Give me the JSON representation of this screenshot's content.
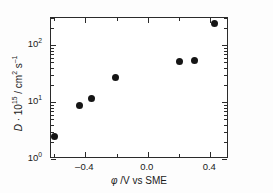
{
  "chart_data": {
    "type": "scatter",
    "title": "",
    "xlabel": "φ /V vs SME",
    "ylabel": "D · 10¹⁵ / cm² s⁻¹",
    "xlim": [
      -0.62,
      0.52
    ],
    "ylim": [
      1,
      300
    ],
    "yscale": "log",
    "xscale": "linear",
    "grid": false,
    "legend": false,
    "x": [
      -0.6,
      -0.44,
      -0.36,
      -0.21,
      0.2,
      0.3,
      0.43
    ],
    "y": [
      2.5,
      8.7,
      11.5,
      27,
      52,
      53,
      240
    ],
    "points": [
      {
        "x": -0.6,
        "y": 2.5
      },
      {
        "x": -0.44,
        "y": 8.7
      },
      {
        "x": -0.36,
        "y": 11.5
      },
      {
        "x": -0.21,
        "y": 27
      },
      {
        "x": 0.2,
        "y": 52
      },
      {
        "x": 0.3,
        "y": 53
      },
      {
        "x": 0.43,
        "y": 240
      }
    ],
    "marker": "filled-circle",
    "marker_color": "#151515",
    "xticks": [
      -0.4,
      0.0,
      0.4
    ],
    "xtick_labels": [
      "–0.4",
      "0.0",
      "0.4"
    ],
    "xticks_minor": [
      -0.6,
      -0.2,
      0.2
    ],
    "yticks": [
      1,
      10,
      100
    ],
    "ytick_labels": [
      "10⁰",
      "10¹",
      "10²"
    ]
  },
  "axis_titles": {
    "x_symbol": "φ",
    "x_rest": " /V vs SME",
    "y_symbol": "D",
    "y_mid": " · 10",
    "y_exp1": "15",
    "y_units": " / cm",
    "y_exp2": "2",
    "y_units2": " s",
    "y_exp3": "–1"
  },
  "ytick_display": [
    {
      "base": "10",
      "exp": "2",
      "value": 100
    },
    {
      "base": "10",
      "exp": "1",
      "value": 10
    },
    {
      "base": "10",
      "exp": "0",
      "value": 1
    }
  ],
  "colors": {
    "marker": "#151515",
    "axis": "#2b2b2b",
    "background": "#ffffff",
    "text": "#1a1a1a"
  }
}
